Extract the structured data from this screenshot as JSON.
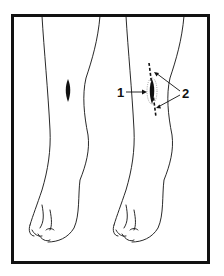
{
  "figure": {
    "labels": [
      {
        "id": "1",
        "text": "1",
        "meaning": "wound"
      },
      {
        "id": "2",
        "text": "2",
        "meaning": "dashed incision line ends"
      }
    ],
    "colors": {
      "ink": "#111111",
      "background": "#ffffff"
    }
  }
}
